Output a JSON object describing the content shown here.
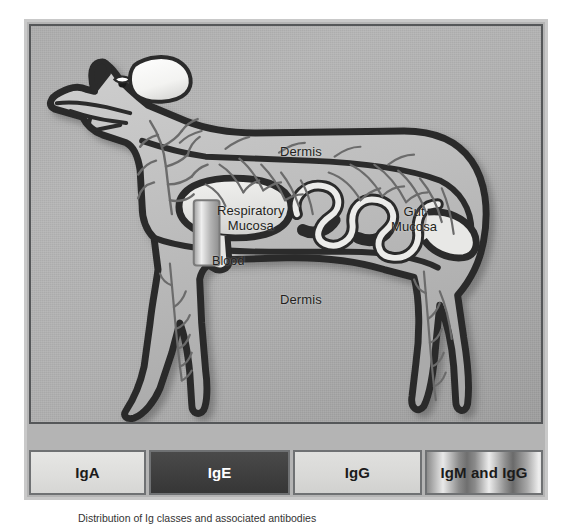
{
  "figure": {
    "caption": "Distribution of Ig classes and associated antibodies"
  },
  "illustration": {
    "alt_name": "dog-immunoglobulin-distribution-diagram",
    "labels": {
      "dermis_top": "Dermis",
      "dermis_bottom": "Dermis",
      "respiratory_mucosa": "Respiratory\nMucosa",
      "blood": "Blood",
      "gut_mucosa": "Gut\nMucosa"
    }
  },
  "legend": {
    "items": [
      {
        "label": "IgA",
        "swatch_color": "#dedede",
        "style": "light"
      },
      {
        "label": "IgE",
        "swatch_color": "#3f3f3f",
        "style": "dark"
      },
      {
        "label": "IgG",
        "swatch_color": "#d9d9d9",
        "style": "light"
      },
      {
        "label": "IgM and IgG",
        "swatch_color": "#9a9a9a",
        "style": "striped"
      }
    ]
  },
  "colors": {
    "page_background": "#ffffff",
    "frame_border": "#c9c9c9",
    "panel_border": "#555759",
    "panel_background": "#b0b0b0",
    "outline_dark": "#2b2b2b",
    "tissue_fill": "#c4c4c4",
    "mucosa_fill": "#e7e7e5",
    "vessel_gray": "#6b6b6b",
    "label_text": "#231f20"
  }
}
